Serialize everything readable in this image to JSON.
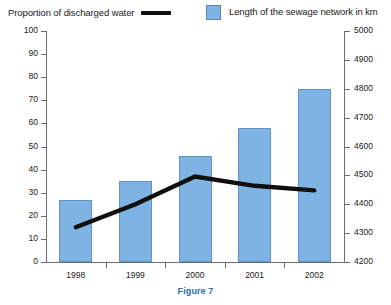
{
  "legend": {
    "line_series_label": "Proportion of discharged water",
    "bar_series_label": "Length of the sewage network in km",
    "line_swatch_icon": "line-swatch",
    "bar_swatch_icon": "square-swatch"
  },
  "caption": {
    "text": "Figure 7"
  },
  "colors": {
    "bar_fill": "#7fb3e3",
    "bar_border": "#5f94c6",
    "line": "#100f0d",
    "axis": "#6d6d6d",
    "caption": "#2f6cb0"
  },
  "chart_data": {
    "type": "bar",
    "title": "",
    "subtitle": "",
    "xlabel": "",
    "ylabel": "",
    "categories": [
      "1998",
      "1999",
      "2000",
      "2001",
      "2002"
    ],
    "grid": false,
    "legend_position": "top",
    "series": [
      {
        "name": "Length of the sewage network in km",
        "type": "bar",
        "axis": "right",
        "values": [
          4320,
          4440,
          4560,
          4670,
          4790
        ],
        "values_left_scale": [
          27,
          35,
          46,
          58,
          75
        ]
      },
      {
        "name": "Proportion of discharged water",
        "type": "line",
        "axis": "left",
        "values": [
          15,
          25,
          37,
          33,
          31
        ]
      }
    ],
    "y_left": {
      "label": "",
      "ticks": [
        0,
        10,
        20,
        30,
        40,
        50,
        60,
        70,
        80,
        90,
        100
      ],
      "ylim": [
        0,
        100
      ]
    },
    "y_right": {
      "label": "",
      "ticks": [
        4200,
        4300,
        4400,
        4500,
        4600,
        4700,
        4800,
        4900,
        5000
      ],
      "ylim": [
        4200,
        5000
      ]
    }
  }
}
